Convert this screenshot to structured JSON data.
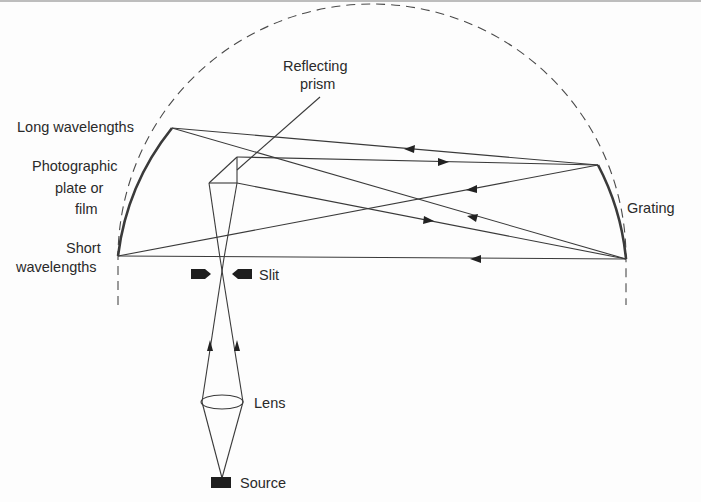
{
  "diagram": {
    "labels": {
      "reflecting_prism_line1": "Reflecting",
      "reflecting_prism_line2": "prism",
      "long_wavelengths": "Long wavelengths",
      "plate_line1": "Photographic",
      "plate_line2": "plate or",
      "plate_line3": "film",
      "short_line1": "Short",
      "short_line2": "wavelengths",
      "grating": "Grating",
      "slit": "Slit",
      "lens": "Lens",
      "source": "Source"
    },
    "components": [
      {
        "id": "source",
        "name": "Source"
      },
      {
        "id": "lens",
        "name": "Lens"
      },
      {
        "id": "slit",
        "name": "Slit"
      },
      {
        "id": "reflecting-prism",
        "name": "Reflecting prism"
      },
      {
        "id": "grating",
        "name": "Grating (concave)"
      },
      {
        "id": "photographic-plate",
        "name": "Photographic plate or film"
      },
      {
        "id": "rowland-circle",
        "name": "Rowland circle (dashed)"
      }
    ],
    "colors": {
      "ink": "#3a3a3a",
      "background": "#fdfdfd"
    }
  }
}
